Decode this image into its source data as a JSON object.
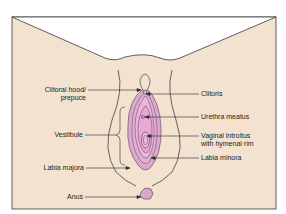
{
  "colors": {
    "background": "#f2e2cf",
    "frame": "#3a3a3a",
    "outline": "#2a2a2a",
    "labia_fill": "#d9a9cf",
    "labia_inner": "#e8b6d8",
    "vestibule_fill": "#eaa6d6",
    "anus_fill": "#d8a8c8",
    "page": "#ffffff"
  },
  "labels": {
    "clitoral_hood_line1": "Clitoral hood/",
    "clitoral_hood_line2": "prepuce",
    "clitoris": "Clitoris",
    "urethra": "Urethra meatus",
    "vaginal_line1": "Vaginal introitus",
    "vaginal_line2": "with hymenal rim",
    "labia_minora": "Labia minora",
    "vestibule": "Vestibule",
    "labia_majora": "Labia majora",
    "anus": "Anus"
  }
}
